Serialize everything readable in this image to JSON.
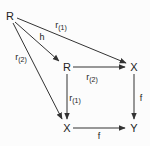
{
  "diagram": {
    "type": "commutative-diagram",
    "nodes": [
      {
        "id": "R0",
        "label": "R",
        "x": 10,
        "y": 16
      },
      {
        "id": "R1",
        "label": "R",
        "x": 66,
        "y": 67
      },
      {
        "id": "X1",
        "label": "X",
        "x": 133,
        "y": 67
      },
      {
        "id": "X2",
        "label": "X",
        "x": 66,
        "y": 127
      },
      {
        "id": "Y",
        "label": "Y",
        "x": 133,
        "y": 127
      }
    ],
    "edges": [
      {
        "from": "R0",
        "to": "X1",
        "label": "r",
        "sub": "(1)"
      },
      {
        "from": "R0",
        "to": "R1",
        "label": "h",
        "sub": ""
      },
      {
        "from": "R0",
        "to": "X2",
        "label": "r",
        "sub": "(2)"
      },
      {
        "from": "R1",
        "to": "X1",
        "label": "r",
        "sub": "(2)"
      },
      {
        "from": "R1",
        "to": "X2",
        "label": "r",
        "sub": "(1)"
      },
      {
        "from": "X1",
        "to": "Y",
        "label": "f",
        "sub": ""
      },
      {
        "from": "X2",
        "to": "Y",
        "label": "f",
        "sub": ""
      }
    ]
  },
  "labels": {
    "n_R0": "R",
    "n_R1": "R",
    "n_X1": "X",
    "n_X2": "X",
    "n_Y": "Y",
    "e_r1_top": "r",
    "e_r1_top_sub": "(1)",
    "e_h": "h",
    "e_r2_left": "r",
    "e_r2_left_sub": "(2)",
    "e_r2_mid": "r",
    "e_r2_mid_sub": "(2)",
    "e_r1_mid": "r",
    "e_r1_mid_sub": "(1)",
    "e_f_right": "f",
    "e_f_bottom": "f"
  }
}
